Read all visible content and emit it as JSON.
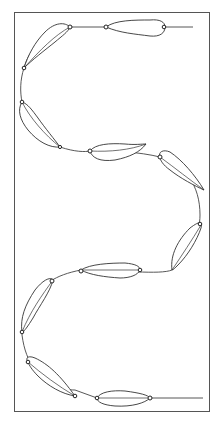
{
  "illustration": {
    "subject": "pod-chain-vine",
    "description": "Line drawing of pods connected along a serpentine stem inside a rectangular frame",
    "pod_count": 10,
    "colors": {
      "stroke": "#333333",
      "frame": "#555555",
      "background": "#ffffff"
    }
  }
}
